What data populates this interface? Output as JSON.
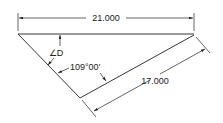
{
  "drawing": {
    "type": "triangle-dimensioning",
    "colors": {
      "line": "#222222",
      "background": "#ffffff"
    },
    "dimensions": {
      "top_length": "21.000",
      "slant_length": "17.000",
      "angle_given": "109°00'",
      "angle_unknown": "∠D"
    }
  }
}
